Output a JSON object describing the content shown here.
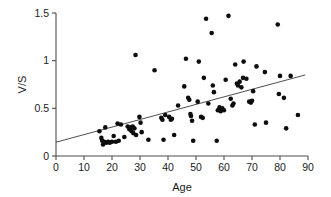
{
  "chart_data": {
    "type": "scatter",
    "title": "",
    "xlabel": "Age",
    "ylabel": "V/S",
    "xlim": [
      0,
      90
    ],
    "ylim": [
      0,
      1.5
    ],
    "xticks": [
      0,
      10,
      20,
      30,
      40,
      50,
      60,
      70,
      80,
      90
    ],
    "xtick_labels": [
      "0",
      "10",
      "20",
      "30",
      "40",
      "50",
      "60",
      "70",
      "80",
      "90"
    ],
    "yticks": [
      0,
      0.5,
      1,
      1.5
    ],
    "ytick_labels": [
      "0",
      "0.5",
      "1",
      "1.5"
    ],
    "grid": false,
    "legend": null,
    "marker_color": "#0d0d0d",
    "marker_size": 4.6,
    "trend_line": {
      "type": "linear-fit",
      "color": "#3a3a3a",
      "x_start": 0,
      "y_start": 0.145,
      "x_end": 89,
      "y_end": 0.85,
      "slope": 0.0079,
      "intercept": 0.145
    },
    "series": [
      {
        "name": "V/S vs Age",
        "points": [
          [
            15.5,
            0.26
          ],
          [
            16.2,
            0.19
          ],
          [
            16.5,
            0.16
          ],
          [
            16.8,
            0.12
          ],
          [
            17.2,
            0.15
          ],
          [
            17.6,
            0.3
          ],
          [
            18.0,
            0.14
          ],
          [
            18.6,
            0.15
          ],
          [
            19.2,
            0.14
          ],
          [
            20.0,
            0.15
          ],
          [
            20.6,
            0.21
          ],
          [
            21.4,
            0.15
          ],
          [
            22.0,
            0.34
          ],
          [
            22.4,
            0.16
          ],
          [
            23.2,
            0.33
          ],
          [
            24.4,
            0.2
          ],
          [
            25.6,
            0.31
          ],
          [
            26.2,
            0.28
          ],
          [
            26.6,
            0.3
          ],
          [
            27.0,
            0.26
          ],
          [
            27.4,
            0.31
          ],
          [
            27.6,
            0.24
          ],
          [
            28.0,
            0.29
          ],
          [
            28.4,
            1.06
          ],
          [
            28.6,
            0.22
          ],
          [
            29.8,
            0.41
          ],
          [
            30.2,
            0.35
          ],
          [
            30.6,
            0.25
          ],
          [
            33.0,
            0.17
          ],
          [
            35.2,
            0.9
          ],
          [
            37.6,
            0.4
          ],
          [
            38.0,
            0.38
          ],
          [
            38.4,
            0.17
          ],
          [
            39.0,
            0.43
          ],
          [
            40.4,
            0.41
          ],
          [
            41.0,
            0.38
          ],
          [
            41.4,
            0.39
          ],
          [
            42.2,
            0.22
          ],
          [
            43.6,
            0.53
          ],
          [
            45.8,
            0.73
          ],
          [
            46.4,
            1.02
          ],
          [
            47.2,
            0.61
          ],
          [
            47.6,
            0.59
          ],
          [
            48.0,
            0.44
          ],
          [
            48.2,
            0.42
          ],
          [
            48.6,
            0.37
          ],
          [
            49.0,
            0.16
          ],
          [
            50.6,
            0.57
          ],
          [
            51.0,
            0.99
          ],
          [
            51.8,
            0.41
          ],
          [
            52.4,
            0.4
          ],
          [
            52.8,
            0.82
          ],
          [
            53.6,
            1.44
          ],
          [
            54.4,
            0.55
          ],
          [
            55.6,
            1.29
          ],
          [
            56.0,
            0.74
          ],
          [
            56.4,
            0.67
          ],
          [
            57.4,
            0.16
          ],
          [
            57.8,
            0.48
          ],
          [
            58.4,
            0.51
          ],
          [
            58.8,
            0.47
          ],
          [
            59.4,
            0.5
          ],
          [
            60.0,
            0.48
          ],
          [
            60.6,
            0.8
          ],
          [
            61.6,
            1.47
          ],
          [
            62.4,
            0.6
          ],
          [
            63.0,
            0.53
          ],
          [
            63.4,
            0.55
          ],
          [
            64.0,
            0.96
          ],
          [
            64.6,
            0.76
          ],
          [
            65.0,
            0.74
          ],
          [
            65.6,
            0.78
          ],
          [
            66.2,
            0.72
          ],
          [
            66.8,
            0.82
          ],
          [
            67.0,
            0.99
          ],
          [
            68.0,
            0.81
          ],
          [
            69.0,
            0.57
          ],
          [
            69.6,
            0.56
          ],
          [
            70.0,
            0.58
          ],
          [
            70.4,
            0.68
          ],
          [
            71.0,
            0.33
          ],
          [
            71.6,
            0.94
          ],
          [
            74.6,
            0.88
          ],
          [
            75.0,
            0.35
          ],
          [
            79.2,
            1.38
          ],
          [
            79.6,
            0.65
          ],
          [
            80.0,
            0.84
          ],
          [
            81.4,
            0.61
          ],
          [
            82.2,
            0.29
          ],
          [
            83.8,
            0.84
          ],
          [
            86.4,
            0.43
          ]
        ]
      }
    ]
  }
}
